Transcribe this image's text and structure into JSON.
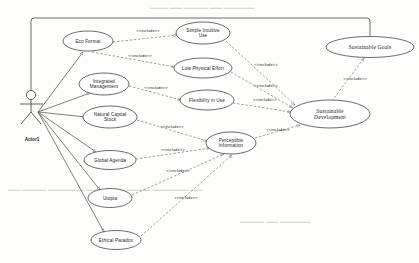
{
  "diagram": {
    "kind": "uml-use-case-diagram",
    "stereotype_label": "<<include>>",
    "colors": {
      "ellipse_stroke": "#3a3a3a",
      "ellipse_fill": "#ffffff",
      "association_line": "#4a4a4a",
      "dependency_line": "#6a6a6a",
      "boundary_line": "#444444",
      "text": "#1a1a1a",
      "background": "#fdfdfc"
    },
    "actor": {
      "name": "Actor1",
      "label_x": 32,
      "label_y": 141,
      "head_cx": 31,
      "head_cy": 95,
      "head_r": 4.6,
      "body_top": 100,
      "body_bottom": 112,
      "arm_y": 104,
      "arm_left": 20,
      "arm_right": 43,
      "leg_left_x": 21,
      "leg_right_x": 41,
      "leg_y": 124
    },
    "boundary": {
      "top_y": 18,
      "left_x": 31,
      "right_x": 370,
      "left_drop_to": 90,
      "right_drop_to": 37,
      "corner_radius": 3
    },
    "use_cases": [
      {
        "id": "eco-format",
        "label": "Eco Format",
        "lines": [
          "Eco Format"
        ],
        "cx": 88,
        "cy": 41,
        "rx": 25,
        "ry": 10,
        "font": "sans"
      },
      {
        "id": "integrated-management",
        "label": "Integrated Management",
        "lines": [
          "Integrated",
          "Management"
        ],
        "cx": 104,
        "cy": 84,
        "rx": 25,
        "ry": 11,
        "font": "sans"
      },
      {
        "id": "natural-capital-stock",
        "label": "Natural Capital Stock",
        "lines": [
          "Natural Capital",
          "Stock"
        ],
        "cx": 110,
        "cy": 117,
        "rx": 27,
        "ry": 11,
        "font": "sans"
      },
      {
        "id": "global-agenda",
        "label": "Global Agenda",
        "lines": [
          "Global Agenda"
        ],
        "cx": 110,
        "cy": 160,
        "rx": 26,
        "ry": 9.5,
        "font": "sans"
      },
      {
        "id": "utopia",
        "label": "Utopia",
        "lines": [
          "Utopia"
        ],
        "cx": 110,
        "cy": 198,
        "rx": 22,
        "ry": 9.5,
        "font": "sans"
      },
      {
        "id": "ethical-paradox",
        "label": "Ethical Paradox",
        "lines": [
          "Ethical Paradox"
        ],
        "cx": 116,
        "cy": 240,
        "rx": 25,
        "ry": 9.5,
        "font": "sans"
      },
      {
        "id": "simple-intuitive-use",
        "label": "Simple Intuitive Use",
        "lines": [
          "Simple Intuitive",
          "Use"
        ],
        "cx": 203,
        "cy": 33,
        "rx": 27,
        "ry": 11,
        "font": "sans"
      },
      {
        "id": "low-physical-effort",
        "label": "Low Physical Effort",
        "lines": [
          "Low Physical Effort"
        ],
        "cx": 203,
        "cy": 68,
        "rx": 29,
        "ry": 10,
        "font": "sans"
      },
      {
        "id": "flexibility-in-use",
        "label": "Flexibility in Use",
        "lines": [
          "Flexibility in Use"
        ],
        "cx": 207,
        "cy": 100,
        "rx": 27,
        "ry": 10,
        "font": "sans"
      },
      {
        "id": "perceptible-information",
        "label": "Perceptible Information",
        "lines": [
          "Perceptible",
          "Information"
        ],
        "cx": 231,
        "cy": 143,
        "rx": 25,
        "ry": 11,
        "font": "sans"
      },
      {
        "id": "sustainable-development",
        "label": "Sustainable Development",
        "lines": [
          "Sustainable",
          "Development"
        ],
        "cx": 330,
        "cy": 114,
        "rx": 40,
        "ry": 14,
        "font": "serif"
      },
      {
        "id": "sustainable-goals",
        "label": "Sustainable Goals",
        "lines": [
          "Sustainable Goals"
        ],
        "cx": 370,
        "cy": 47,
        "rx": 44,
        "ry": 10.5,
        "font": "serif"
      }
    ],
    "associations": [
      {
        "id": "actor-to-eco-format",
        "from": "Actor1",
        "to": "eco-format",
        "x1": 38,
        "y1": 112,
        "x2": 83,
        "y2": 52
      },
      {
        "id": "actor-to-integrated-management",
        "from": "Actor1",
        "to": "integrated-management",
        "x1": 38,
        "y1": 112,
        "x2": 90,
        "y2": 93
      },
      {
        "id": "actor-to-natural-capital-stock",
        "from": "Actor1",
        "to": "natural-capital-stock",
        "x1": 38,
        "y1": 112,
        "x2": 86,
        "y2": 117
      },
      {
        "id": "actor-to-global-agenda",
        "from": "Actor1",
        "to": "global-agenda",
        "x1": 38,
        "y1": 112,
        "x2": 96,
        "y2": 152
      },
      {
        "id": "actor-to-utopia",
        "from": "Actor1",
        "to": "utopia",
        "x1": 38,
        "y1": 112,
        "x2": 100,
        "y2": 190
      },
      {
        "id": "actor-to-ethical-paradox",
        "from": "Actor1",
        "to": "ethical-paradox",
        "x1": 38,
        "y1": 112,
        "x2": 104,
        "y2": 232
      }
    ],
    "includes": [
      {
        "id": "inc-eco-format-simple-intuitive-use",
        "from": "eco-format",
        "to": "simple-intuitive-use",
        "x1": 113,
        "y1": 42,
        "x2": 177,
        "y2": 35,
        "lx": 148,
        "ly": 32
      },
      {
        "id": "inc-eco-format-low-physical-effort",
        "from": "eco-format",
        "to": "low-physical-effort",
        "x1": 92,
        "y1": 52,
        "x2": 175,
        "y2": 67,
        "lx": 140,
        "ly": 57
      },
      {
        "id": "inc-integrated-management-flexibility-in-use",
        "from": "integrated-management",
        "to": "flexibility-in-use",
        "x1": 129,
        "y1": 86,
        "x2": 181,
        "y2": 100,
        "lx": 156,
        "ly": 89
      },
      {
        "id": "inc-natural-capital-stock-perceptible",
        "from": "natural-capital-stock",
        "to": "perceptible-information",
        "x1": 137,
        "y1": 120,
        "x2": 207,
        "y2": 141,
        "lx": 172,
        "ly": 128
      },
      {
        "id": "inc-global-agenda-perceptible",
        "from": "global-agenda",
        "to": "perceptible-information",
        "x1": 136,
        "y1": 159,
        "x2": 210,
        "y2": 148,
        "lx": 173,
        "ly": 151
      },
      {
        "id": "inc-utopia-perceptible",
        "from": "utopia",
        "to": "perceptible-information",
        "x1": 132,
        "y1": 195,
        "x2": 224,
        "y2": 154,
        "lx": 178,
        "ly": 172
      },
      {
        "id": "inc-ethical-paradox-perceptible",
        "from": "ethical-paradox",
        "to": "perceptible-information",
        "x1": 141,
        "y1": 236,
        "x2": 232,
        "y2": 155,
        "lx": 186,
        "ly": 199
      },
      {
        "id": "inc-simple-intuitive-use-sustainable-dev",
        "from": "simple-intuitive-use",
        "to": "sustainable-development",
        "x1": 226,
        "y1": 41,
        "x2": 295,
        "y2": 105,
        "lx": 266,
        "ly": 66
      },
      {
        "id": "inc-low-physical-effort-sustainable-dev",
        "from": "low-physical-effort",
        "to": "sustainable-development",
        "x1": 231,
        "y1": 72,
        "x2": 293,
        "y2": 108,
        "lx": 266,
        "ly": 87
      },
      {
        "id": "inc-flexibility-in-use-sustainable-dev",
        "from": "flexibility-in-use",
        "to": "sustainable-development",
        "x1": 233,
        "y1": 103,
        "x2": 291,
        "y2": 112,
        "lx": 265,
        "ly": 101
      },
      {
        "id": "inc-perceptible-sustainable-dev",
        "from": "perceptible-information",
        "to": "sustainable-development",
        "x1": 255,
        "y1": 138,
        "x2": 300,
        "y2": 125,
        "lx": 278,
        "ly": 131
      },
      {
        "id": "inc-sustainable-dev-sustainable-goals",
        "from": "sustainable-development",
        "to": "sustainable-goals",
        "x1": 332,
        "y1": 101,
        "x2": 364,
        "y2": 58,
        "lx": 355,
        "ly": 80
      }
    ]
  }
}
